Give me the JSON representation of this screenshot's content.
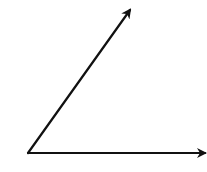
{
  "diagram": {
    "type": "angle",
    "background": "#ffffff",
    "stroke_color": "#111111",
    "stroke_width": 2.2,
    "vertex": {
      "x": 28,
      "y": 153
    },
    "rays": [
      {
        "name": "ray-upper",
        "x1": 28,
        "y1": 153,
        "x2": 130,
        "y2": 10
      },
      {
        "name": "ray-horizontal",
        "x1": 28,
        "y1": 153,
        "x2": 205,
        "y2": 153
      }
    ]
  }
}
